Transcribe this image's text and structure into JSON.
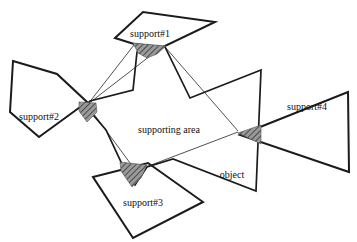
{
  "figure": {
    "background_color": "#ffffff",
    "outline_color": "#1b1b1b",
    "thin_line_color": "#3d3d3d",
    "patch_base_color": "#9a9a9a",
    "patch_hatch_color": "#373737",
    "labels": {
      "supporting_area": "supporting area",
      "object": "object"
    },
    "label_positions": {
      "supporting_area": [
        169,
        129
      ],
      "object": [
        232,
        174
      ]
    },
    "supports": [
      {
        "label": "support#1",
        "label_xy": [
          150,
          33
        ],
        "points": [
          [
            115,
            38
          ],
          [
            143,
            12
          ],
          [
            215,
            22
          ],
          [
            163,
            47
          ],
          [
            134,
            44
          ]
        ]
      },
      {
        "label": "support#2",
        "label_xy": [
          39,
          116
        ],
        "points": [
          [
            13,
            61
          ],
          [
            57,
            74
          ],
          [
            87,
            102
          ],
          [
            39,
            137
          ],
          [
            10,
            112
          ]
        ]
      },
      {
        "label": "support#3",
        "label_xy": [
          143,
          202
        ],
        "points": [
          [
            93,
            177
          ],
          [
            148,
            163
          ],
          [
            203,
            202
          ],
          [
            133,
            238
          ]
        ]
      },
      {
        "label": "support#4",
        "label_xy": [
          307,
          106
        ],
        "points": [
          [
            240,
            135
          ],
          [
            348,
            92
          ],
          [
            349,
            172
          ]
        ]
      }
    ],
    "object_outline": {
      "points": [
        [
          137,
          52
        ],
        [
          165,
          47
        ],
        [
          190,
          98
        ],
        [
          261,
          70
        ],
        [
          256,
          191
        ],
        [
          173,
          159
        ],
        [
          147,
          167
        ],
        [
          135,
          185
        ],
        [
          122,
          164
        ],
        [
          106,
          130
        ],
        [
          94,
          116
        ],
        [
          81,
          110
        ],
        [
          90,
          101
        ],
        [
          133,
          90
        ]
      ]
    },
    "supporting_area_lines": [
      {
        "name": "support2-to-support1-left",
        "x1": 88,
        "y1": 104,
        "x2": 134,
        "y2": 45
      },
      {
        "name": "support2-to-support1-tip",
        "x1": 88,
        "y1": 104,
        "x2": 150,
        "y2": 56
      },
      {
        "name": "support1-to-support4",
        "x1": 166,
        "y1": 48,
        "x2": 238,
        "y2": 131
      },
      {
        "name": "support4-to-support3",
        "x1": 238,
        "y1": 132,
        "x2": 138,
        "y2": 170
      },
      {
        "name": "support3-to-support2",
        "x1": 133,
        "y1": 167,
        "x2": 88,
        "y2": 106
      }
    ],
    "contact_patches": [
      {
        "name": "contact-patch-1",
        "points": [
          [
            133,
            43
          ],
          [
            166,
            46
          ],
          [
            157,
            54
          ],
          [
            147,
            58
          ],
          [
            138,
            53
          ]
        ]
      },
      {
        "name": "contact-patch-2",
        "points": [
          [
            79,
            102
          ],
          [
            96,
            103
          ],
          [
            97,
            112
          ],
          [
            87,
            122
          ],
          [
            79,
            111
          ]
        ]
      },
      {
        "name": "contact-patch-3",
        "points": [
          [
            120,
            162
          ],
          [
            147,
            165
          ],
          [
            141,
            178
          ],
          [
            132,
            187
          ],
          [
            121,
            171
          ]
        ]
      },
      {
        "name": "contact-patch-4",
        "points": [
          [
            238,
            133
          ],
          [
            261,
            125
          ],
          [
            261,
            144
          ]
        ]
      }
    ]
  }
}
